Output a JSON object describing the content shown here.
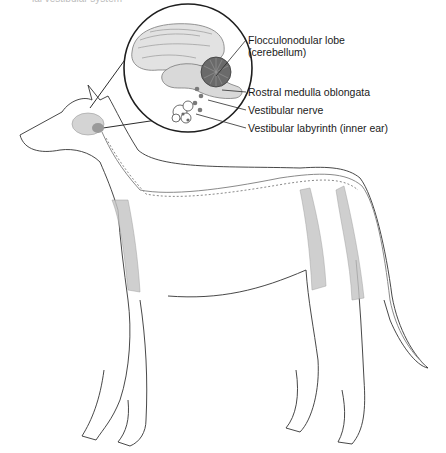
{
  "figure": {
    "top_partial_text": "ial vestibular system",
    "labels": [
      {
        "id": "flocculonodular",
        "line1": "Flocculonodular lobe",
        "line2": "(cerebellum)"
      },
      {
        "id": "medulla",
        "line1": "Rostral medulla oblongata"
      },
      {
        "id": "nerve",
        "line1": "Vestibular nerve"
      },
      {
        "id": "labyrinth",
        "line1": "Vestibular labyrinth (inner ear)"
      }
    ],
    "colors": {
      "line": "#2b2b2b",
      "brain_fill": "#cfcfcf",
      "cerebellum_fill": "#6e6e6e",
      "muscle": "#9a9a9a",
      "dots": "#7a7a7a"
    }
  }
}
